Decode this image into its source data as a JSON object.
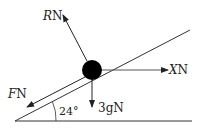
{
  "diagram": {
    "type": "force-diagram",
    "incline_angle_label": "24°",
    "forces": [
      {
        "id": "R",
        "symbol": "R",
        "unit": "N",
        "direction": "perpendicular to plane, away"
      },
      {
        "id": "X",
        "symbol": "X",
        "unit": "N",
        "direction": "horizontal"
      },
      {
        "id": "F",
        "symbol": "F",
        "unit": "N",
        "direction": "down the plane"
      },
      {
        "id": "W",
        "symbol": "3g",
        "unit": "N",
        "direction": "vertically down"
      }
    ],
    "colors": {
      "line": "#333333",
      "ball": "#000000",
      "ground": "#777777"
    }
  },
  "labels": {
    "R_sym": "R",
    "R_unit": "N",
    "X_sym": "X",
    "X_unit": "N",
    "F_sym": "F",
    "F_unit": "N",
    "W_text": "3gN",
    "angle": "24°"
  }
}
